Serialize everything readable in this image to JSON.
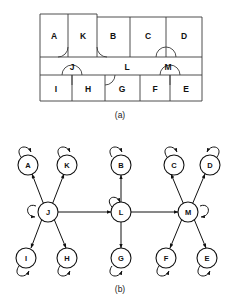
{
  "figure": {
    "panel_a": {
      "caption": "(a)",
      "description": "floorplan",
      "rooms": [
        {
          "id": "A",
          "label": "A"
        },
        {
          "id": "K",
          "label": "K"
        },
        {
          "id": "B",
          "label": "B"
        },
        {
          "id": "C",
          "label": "C"
        },
        {
          "id": "D",
          "label": "D"
        },
        {
          "id": "J",
          "label": "J"
        },
        {
          "id": "L",
          "label": "L"
        },
        {
          "id": "M",
          "label": "M"
        },
        {
          "id": "I",
          "label": "I"
        },
        {
          "id": "H",
          "label": "H"
        },
        {
          "id": "G",
          "label": "G"
        },
        {
          "id": "F",
          "label": "F"
        },
        {
          "id": "E",
          "label": "E"
        }
      ]
    },
    "panel_b": {
      "caption": "(b)",
      "description": "transition graph",
      "nodes": [
        {
          "id": "A",
          "label": "A"
        },
        {
          "id": "K",
          "label": "K"
        },
        {
          "id": "B",
          "label": "B"
        },
        {
          "id": "C",
          "label": "C"
        },
        {
          "id": "D",
          "label": "D"
        },
        {
          "id": "J",
          "label": "J"
        },
        {
          "id": "L",
          "label": "L"
        },
        {
          "id": "M",
          "label": "M"
        },
        {
          "id": "I",
          "label": "I"
        },
        {
          "id": "H",
          "label": "H"
        },
        {
          "id": "G",
          "label": "G"
        },
        {
          "id": "F",
          "label": "F"
        },
        {
          "id": "E",
          "label": "E"
        }
      ],
      "self_loops": [
        "A",
        "K",
        "B",
        "C",
        "D",
        "J",
        "L",
        "M",
        "I",
        "H",
        "G",
        "F",
        "E"
      ],
      "edges": [
        {
          "from": "J",
          "to": "A",
          "type": "bidirectional"
        },
        {
          "from": "J",
          "to": "K",
          "type": "bidirectional"
        },
        {
          "from": "J",
          "to": "I",
          "type": "bidirectional"
        },
        {
          "from": "J",
          "to": "H",
          "type": "bidirectional"
        },
        {
          "from": "L",
          "to": "B",
          "type": "bidirectional"
        },
        {
          "from": "L",
          "to": "G",
          "type": "bidirectional"
        },
        {
          "from": "M",
          "to": "C",
          "type": "bidirectional"
        },
        {
          "from": "M",
          "to": "D",
          "type": "bidirectional"
        },
        {
          "from": "M",
          "to": "F",
          "type": "bidirectional"
        },
        {
          "from": "M",
          "to": "E",
          "type": "bidirectional"
        },
        {
          "from": "J",
          "to": "L",
          "type": "bidirectional"
        },
        {
          "from": "L",
          "to": "M",
          "type": "bidirectional"
        }
      ]
    },
    "colors": {
      "wall": "#3a3a3a",
      "node_stroke": "#111111",
      "node_fill": "#ffffff",
      "edge": "#111111",
      "background": "#ffffff"
    }
  }
}
